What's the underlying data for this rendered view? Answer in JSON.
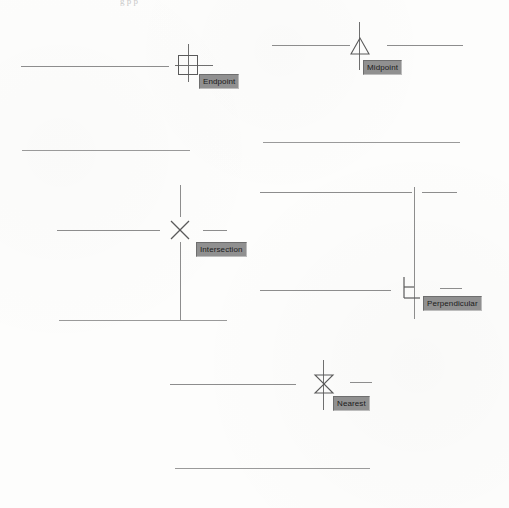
{
  "figure": {
    "top_remnant_text": "g p p",
    "background_color": "#fdfdfc",
    "line_color": "#8d8d8d",
    "marker_color": "#5a5a5a",
    "tooltip_background": "#909090",
    "tooltip_text_color": "#1b1b1b"
  },
  "panels": [
    {
      "id": "endpoint",
      "snap_name": "Endpoint",
      "marker_shape": "square",
      "tooltip_label": "Endpoint"
    },
    {
      "id": "midpoint",
      "snap_name": "Midpoint",
      "marker_shape": "triangle",
      "tooltip_label": "Midpoint"
    },
    {
      "id": "intersection",
      "snap_name": "Intersection",
      "marker_shape": "x-cross",
      "tooltip_label": "Intersection"
    },
    {
      "id": "perpendicular",
      "snap_name": "Perpendicular",
      "marker_shape": "right-angle",
      "tooltip_label": "Perpendicular"
    },
    {
      "id": "nearest",
      "snap_name": "Nearest",
      "marker_shape": "bowtie",
      "tooltip_label": "Nearest"
    }
  ]
}
